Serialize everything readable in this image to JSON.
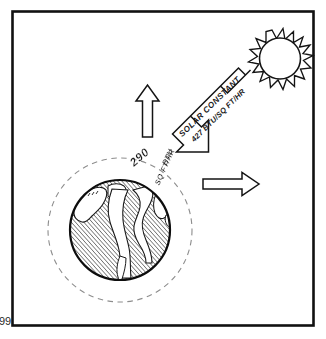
{
  "figure": {
    "name": "earth-solar-radiation-balance-diagram",
    "page_number": "99",
    "frame": {
      "border_color": "#000000"
    },
    "sun": {
      "name": "sun-symbol",
      "description": "spiky-sun-icon"
    },
    "earth": {
      "name": "earth-globe",
      "description": "hatched-globe-with-continents",
      "atmosphere": "dashed-atmosphere-circle"
    },
    "incoming_arrow": {
      "name": "solar-constant-arrow",
      "label_line1": "SOLAR CONSTANT",
      "label_line2": "427 BTU/SQ FT/HR",
      "direction": "down-left"
    },
    "earth_label": {
      "name": "earth-radiation-label",
      "number": "290",
      "unit_top": "BTU",
      "unit_bottom": "SQ FT/HR"
    },
    "outgoing_arrows": [
      {
        "name": "outgoing-arrow-up",
        "direction": "up"
      },
      {
        "name": "outgoing-arrow-right",
        "direction": "right"
      }
    ],
    "colors": {
      "ink": "#1a1a1a",
      "hatch": "#4a4a4a",
      "paper": "#ffffff",
      "dashed": "#8a8a8a"
    }
  }
}
